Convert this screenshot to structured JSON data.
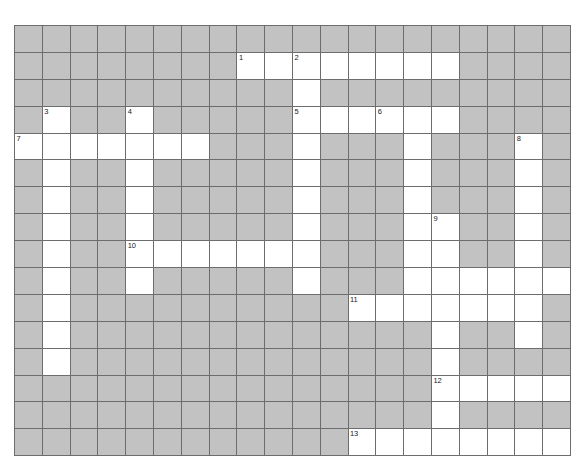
{
  "puzzle": {
    "title": "Crossword Puzzle Grid",
    "rows": 16,
    "cols": 20,
    "cell_size_px": 27.8,
    "colors": {
      "block_fill": "#c2c2c2",
      "open_fill": "#ffffff",
      "grid_line": "#6d6d6d",
      "number_text": "#1a1a1a",
      "page_background": "#ffffff"
    },
    "legend": {
      "block_meaning": "shaded / unused square",
      "open_meaning": "white / fillable square"
    },
    "clue_numbers": [
      {
        "n": "1",
        "row": 1,
        "col": 8
      },
      {
        "n": "2",
        "row": 1,
        "col": 10
      },
      {
        "n": "3",
        "row": 3,
        "col": 1
      },
      {
        "n": "4",
        "row": 3,
        "col": 4
      },
      {
        "n": "5",
        "row": 3,
        "col": 10
      },
      {
        "n": "6",
        "row": 3,
        "col": 13
      },
      {
        "n": "7",
        "row": 4,
        "col": 0
      },
      {
        "n": "8",
        "row": 4,
        "col": 18
      },
      {
        "n": "9",
        "row": 7,
        "col": 15
      },
      {
        "n": "10",
        "row": 8,
        "col": 4
      },
      {
        "n": "11",
        "row": 10,
        "col": 12
      },
      {
        "n": "12",
        "row": 13,
        "col": 15
      },
      {
        "n": "13",
        "row": 15,
        "col": 12
      }
    ],
    "grid": [
      [
        0,
        0,
        0,
        0,
        0,
        0,
        0,
        0,
        0,
        0,
        0,
        0,
        0,
        0,
        0,
        0,
        0,
        0,
        0,
        0
      ],
      [
        0,
        0,
        0,
        0,
        0,
        0,
        0,
        0,
        1,
        1,
        1,
        1,
        1,
        1,
        1,
        1,
        0,
        0,
        0,
        0
      ],
      [
        0,
        0,
        0,
        0,
        0,
        0,
        0,
        0,
        0,
        0,
        1,
        0,
        0,
        0,
        0,
        0,
        0,
        0,
        0,
        0
      ],
      [
        0,
        1,
        0,
        0,
        1,
        0,
        0,
        0,
        0,
        0,
        1,
        1,
        1,
        1,
        1,
        1,
        0,
        0,
        0,
        0
      ],
      [
        1,
        1,
        1,
        1,
        1,
        1,
        1,
        0,
        0,
        0,
        1,
        0,
        0,
        0,
        1,
        0,
        0,
        0,
        1,
        0
      ],
      [
        0,
        1,
        0,
        0,
        1,
        0,
        0,
        0,
        0,
        0,
        1,
        0,
        0,
        0,
        1,
        0,
        0,
        0,
        1,
        0
      ],
      [
        0,
        1,
        0,
        0,
        1,
        0,
        0,
        0,
        0,
        0,
        1,
        0,
        0,
        0,
        1,
        0,
        0,
        0,
        1,
        0
      ],
      [
        0,
        1,
        0,
        0,
        1,
        0,
        0,
        0,
        0,
        0,
        1,
        0,
        0,
        0,
        1,
        1,
        0,
        0,
        1,
        0
      ],
      [
        0,
        1,
        0,
        0,
        1,
        1,
        1,
        1,
        1,
        1,
        1,
        0,
        0,
        0,
        1,
        1,
        0,
        0,
        1,
        0
      ],
      [
        0,
        1,
        0,
        0,
        1,
        0,
        0,
        0,
        0,
        0,
        1,
        0,
        0,
        0,
        1,
        1,
        1,
        1,
        1,
        1
      ],
      [
        0,
        1,
        0,
        0,
        0,
        0,
        0,
        0,
        0,
        0,
        0,
        0,
        1,
        1,
        1,
        1,
        1,
        1,
        1,
        0
      ],
      [
        0,
        1,
        0,
        0,
        0,
        0,
        0,
        0,
        0,
        0,
        0,
        0,
        0,
        0,
        0,
        1,
        0,
        0,
        1,
        0
      ],
      [
        0,
        1,
        0,
        0,
        0,
        0,
        0,
        0,
        0,
        0,
        0,
        0,
        0,
        0,
        0,
        1,
        0,
        0,
        0,
        0
      ],
      [
        0,
        0,
        0,
        0,
        0,
        0,
        0,
        0,
        0,
        0,
        0,
        0,
        0,
        0,
        0,
        1,
        1,
        1,
        1,
        1
      ],
      [
        0,
        0,
        0,
        0,
        0,
        0,
        0,
        0,
        0,
        0,
        0,
        0,
        0,
        0,
        0,
        1,
        0,
        0,
        0,
        0
      ],
      [
        0,
        0,
        0,
        0,
        0,
        0,
        0,
        0,
        0,
        0,
        0,
        0,
        1,
        1,
        1,
        1,
        1,
        1,
        1,
        1
      ]
    ]
  }
}
